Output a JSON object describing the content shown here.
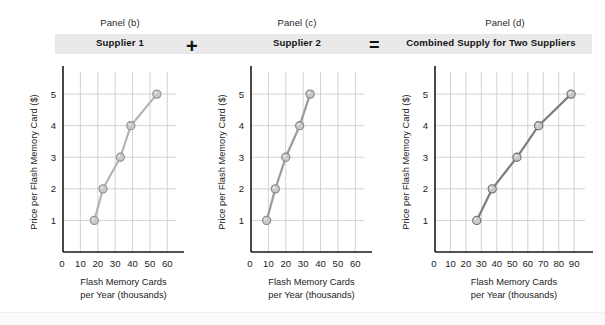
{
  "figure": {
    "background": "#ffffff",
    "band_color": "#e9e9e9",
    "panels": [
      {
        "caption": "Panel (b)",
        "title": "Supplier 1",
        "operator": "",
        "x_ticks": [
          "0",
          "10",
          "20",
          "30",
          "40",
          "50",
          "60"
        ],
        "y_ticks": [
          "1",
          "2",
          "3",
          "4",
          "5"
        ],
        "xlabel_line1": "Flash Memory Cards",
        "xlabel_line2": "per Year (thousands)",
        "ylabel": "Price per Flash Memory Card ($)"
      },
      {
        "caption": "Panel (c)",
        "title": "Supplier 2",
        "operator": "+",
        "x_ticks": [
          "0",
          "10",
          "20",
          "30",
          "40",
          "50",
          "60"
        ],
        "y_ticks": [
          "1",
          "2",
          "3",
          "4",
          "5"
        ],
        "xlabel_line1": "Flash Memory Cards",
        "xlabel_line2": "per Year (thousands)",
        "ylabel": "Price per Flash Memory Card ($)"
      },
      {
        "caption": "Panel (d)",
        "title": "Combined Supply for Two Suppliers",
        "operator": "=",
        "x_ticks": [
          "0",
          "10",
          "20",
          "30",
          "40",
          "50",
          "60",
          "70",
          "80",
          "90"
        ],
        "y_ticks": [
          "1",
          "2",
          "3",
          "4",
          "5"
        ],
        "xlabel_line1": "Flash Memory Cards",
        "xlabel_line2": "per Year (thousands)",
        "ylabel": "Price per Flash Memory Card ($)"
      }
    ]
  },
  "chart_data": [
    {
      "type": "line",
      "title": "Supplier 1",
      "panel": "Panel (b)",
      "xlabel": "Flash Memory Cards per Year (thousands)",
      "ylabel": "Price per Flash Memory Card ($)",
      "x": [
        18,
        23,
        33,
        39,
        54
      ],
      "y": [
        1,
        2,
        3,
        4,
        5
      ],
      "xlim": [
        0,
        65
      ],
      "ylim": [
        0,
        5.7
      ],
      "xticks": [
        0,
        10,
        20,
        30,
        40,
        50,
        60
      ],
      "yticks": [
        1,
        2,
        3,
        4,
        5
      ],
      "grid": true,
      "legend": "none",
      "marker": "circle",
      "line_color": "#b4b4b4",
      "marker_fill": "#c9c9c9",
      "marker_edge": "#8f8f8f"
    },
    {
      "type": "line",
      "title": "Supplier 2",
      "panel": "Panel (c)",
      "xlabel": "Flash Memory Cards per Year (thousands)",
      "ylabel": "Price per Flash Memory Card ($)",
      "x": [
        9,
        14,
        20,
        28,
        34
      ],
      "y": [
        1,
        2,
        3,
        4,
        5
      ],
      "xlim": [
        0,
        65
      ],
      "ylim": [
        0,
        5.7
      ],
      "xticks": [
        0,
        10,
        20,
        30,
        40,
        50,
        60
      ],
      "yticks": [
        1,
        2,
        3,
        4,
        5
      ],
      "grid": true,
      "legend": "none",
      "marker": "circle",
      "line_color": "#9b9b9b",
      "marker_fill": "#c9c9c9",
      "marker_edge": "#858585"
    },
    {
      "type": "line",
      "title": "Combined Supply for Two Suppliers",
      "panel": "Panel (d)",
      "xlabel": "Flash Memory Cards per Year (thousands)",
      "ylabel": "Price per Flash Memory Card ($)",
      "x": [
        27,
        37,
        53,
        67,
        88
      ],
      "y": [
        1,
        2,
        3,
        4,
        5
      ],
      "xlim": [
        0,
        97
      ],
      "ylim": [
        0,
        5.7
      ],
      "xticks": [
        0,
        10,
        20,
        30,
        40,
        50,
        60,
        70,
        80,
        90
      ],
      "yticks": [
        1,
        2,
        3,
        4,
        5
      ],
      "grid": true,
      "legend": "none",
      "marker": "circle",
      "line_color": "#7d7d7d",
      "marker_fill": "#c9c9c9",
      "marker_edge": "#6e6e6e"
    }
  ]
}
